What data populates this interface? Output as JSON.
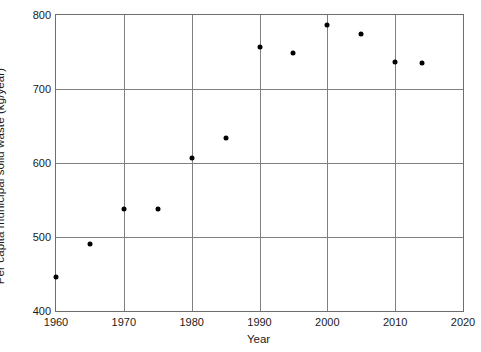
{
  "chart_data": {
    "type": "scatter",
    "title": "",
    "xlabel": "Year",
    "ylabel": "Per capita municipal solid waste (kg/year)",
    "xlim": [
      1960,
      2020
    ],
    "ylim": [
      400,
      800
    ],
    "xticks": [
      1960,
      1970,
      1980,
      1990,
      2000,
      2010,
      2020
    ],
    "yticks": [
      400,
      500,
      600,
      700,
      800
    ],
    "grid": true,
    "legend": null,
    "marker_color": "#000000",
    "grid_color": "#808080",
    "axis_color": "#6e6e6e",
    "x": [
      1960,
      1965,
      1970,
      1975,
      1980,
      1985,
      1990,
      1995,
      2000,
      2005,
      2010,
      2014
    ],
    "y": [
      446,
      490,
      538,
      538,
      607,
      634,
      757,
      749,
      786,
      775,
      737,
      735
    ],
    "points": [
      {
        "x": 1960,
        "y": 446
      },
      {
        "x": 1965,
        "y": 490
      },
      {
        "x": 1970,
        "y": 538
      },
      {
        "x": 1975,
        "y": 538
      },
      {
        "x": 1980,
        "y": 607
      },
      {
        "x": 1985,
        "y": 634
      },
      {
        "x": 1990,
        "y": 757
      },
      {
        "x": 1995,
        "y": 749
      },
      {
        "x": 2000,
        "y": 786
      },
      {
        "x": 2005,
        "y": 775
      },
      {
        "x": 2010,
        "y": 737
      },
      {
        "x": 2014,
        "y": 735
      }
    ]
  }
}
